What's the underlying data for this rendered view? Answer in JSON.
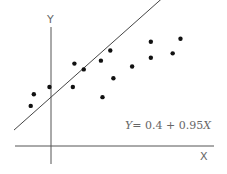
{
  "chart_data": {
    "type": "scatter",
    "title": "",
    "xlabel": "X",
    "ylabel": "Y",
    "xlim": [
      -2.4,
      10.5
    ],
    "ylim": [
      -1.1,
      7.8
    ],
    "grid": false,
    "points": [
      {
        "x": -1.3,
        "y": -0.2
      },
      {
        "x": -1.1,
        "y": 0.6
      },
      {
        "x": -0.1,
        "y": 1.1
      },
      {
        "x": 1.4,
        "y": 1.1
      },
      {
        "x": 1.5,
        "y": 2.7
      },
      {
        "x": 2.1,
        "y": 2.3
      },
      {
        "x": 3.2,
        "y": 2.9
      },
      {
        "x": 3.3,
        "y": 0.4
      },
      {
        "x": 3.8,
        "y": 3.6
      },
      {
        "x": 4.0,
        "y": 1.7
      },
      {
        "x": 5.2,
        "y": 2.5
      },
      {
        "x": 6.4,
        "y": 4.2
      },
      {
        "x": 6.4,
        "y": 3.1
      },
      {
        "x": 7.8,
        "y": 3.4
      },
      {
        "x": 8.3,
        "y": 4.4
      }
    ],
    "fit_line": {
      "intercept": 0.4,
      "slope": 0.95
    },
    "annotations": [
      {
        "text_parts": [
          {
            "text": "Y",
            "italic": true
          },
          {
            "text": "= 0.4 + 0.95",
            "italic": false
          },
          {
            "text": "X",
            "italic": true
          }
        ],
        "placement": "lower-right"
      }
    ],
    "legend": null
  }
}
